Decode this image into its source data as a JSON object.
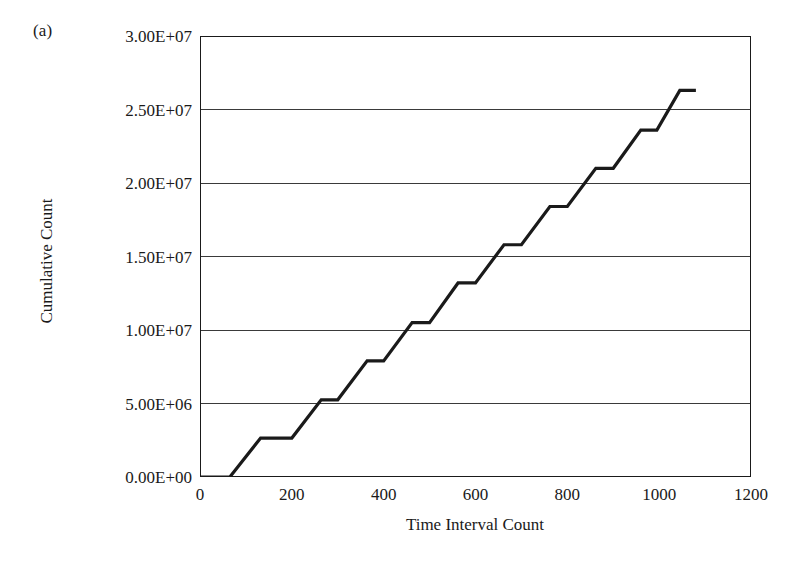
{
  "figure": {
    "panel_label": "(a)",
    "background_color": "#ffffff",
    "line_color": "#1a1a1a",
    "axis_color": "#1a1a1a",
    "grid_color": "#3a3a3a"
  },
  "chart_data": {
    "type": "line",
    "title": "",
    "subtitle": "",
    "panel_label": "(a)",
    "xlabel": "Time Interval Count",
    "ylabel": "Cumulative Count",
    "xlim": [
      0,
      1200
    ],
    "ylim": [
      0,
      30000000
    ],
    "xticks": [
      0,
      200,
      400,
      600,
      800,
      1000,
      1200
    ],
    "xticklabels": [
      "0",
      "200",
      "400",
      "600",
      "800",
      "1000",
      "1200"
    ],
    "yticks": [
      0,
      5000000,
      10000000,
      15000000,
      20000000,
      25000000,
      30000000
    ],
    "yticklabels": [
      "0.00E+00",
      "5.00E+06",
      "1.00E+07",
      "1.50E+07",
      "2.00E+07",
      "2.50E+07",
      "3.00E+07"
    ],
    "grid": "horizontal",
    "legend": "none",
    "annotations": [],
    "series": [
      {
        "name": "Cumulative Count",
        "style": "staircase",
        "description": "Flat at zero until t=65, then a repeating ramp-and-plateau staircase climbing to 2.63E+07 at t=1080",
        "x": [
          0,
          65,
          130,
          200,
          262,
          330,
          392,
          455,
          520,
          585,
          648,
          712,
          775,
          840,
          903,
          968,
          1018,
          1080
        ],
        "y": [
          0,
          0,
          2650000,
          2650000,
          5250000,
          5250000,
          7850000,
          7850000,
          10450000,
          10450000,
          13150000,
          13150000,
          15750000,
          15750000,
          18350000,
          18350000,
          21000000,
          21000000
        ]
      }
    ],
    "staircase_points": [
      {
        "x": 0,
        "y": 0
      },
      {
        "x": 65,
        "y": 0
      },
      {
        "x": 132,
        "y": 2650000
      },
      {
        "x": 200,
        "y": 2650000
      },
      {
        "x": 264,
        "y": 5250000
      },
      {
        "x": 300,
        "y": 5250000
      },
      {
        "x": 364,
        "y": 7900000
      },
      {
        "x": 400,
        "y": 7900000
      },
      {
        "x": 462,
        "y": 10500000
      },
      {
        "x": 500,
        "y": 10500000
      },
      {
        "x": 562,
        "y": 13200000
      },
      {
        "x": 600,
        "y": 13200000
      },
      {
        "x": 662,
        "y": 15800000
      },
      {
        "x": 700,
        "y": 15800000
      },
      {
        "x": 762,
        "y": 18400000
      },
      {
        "x": 800,
        "y": 18400000
      },
      {
        "x": 862,
        "y": 21000000
      },
      {
        "x": 900,
        "y": 21000000
      },
      {
        "x": 960,
        "y": 23600000
      },
      {
        "x": 995,
        "y": 23600000
      },
      {
        "x": 1045,
        "y": 26300000
      },
      {
        "x": 1080,
        "y": 26300000
      }
    ]
  }
}
